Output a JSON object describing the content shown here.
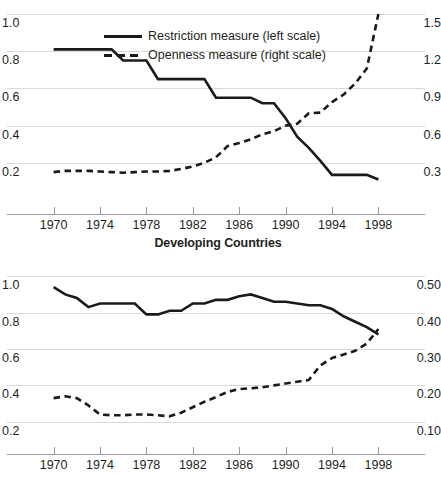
{
  "legend": {
    "items": [
      {
        "label": "Restriction measure (left scale)",
        "style": "solid",
        "key_name": "legend-key-solid"
      },
      {
        "label": "Openness measure (right scale)",
        "style": "dashed",
        "key_name": "legend-key-dashed"
      }
    ]
  },
  "panels": [
    {
      "id": "top",
      "title": "",
      "chart_data": {
        "type": "line",
        "title": "",
        "xlabel": "",
        "ylabel": "",
        "xlim": [
          1969,
          1999
        ],
        "x_ticks": [
          1970,
          1974,
          1978,
          1982,
          1986,
          1990,
          1994,
          1998
        ],
        "left_axis": {
          "label": "Restriction measure",
          "ticks": [
            "1.0",
            "0.8",
            "0.6",
            "0.4",
            "0.2"
          ],
          "values": [
            1.0,
            0.8,
            0.6,
            0.4,
            0.2
          ],
          "ylim": [
            0.0,
            1.0
          ]
        },
        "right_axis": {
          "label": "Openness measure",
          "ticks": [
            "1.5",
            "1.2",
            "0.9",
            "0.6",
            "0.3"
          ],
          "values": [
            1.5,
            1.2,
            0.9,
            0.6,
            0.3
          ],
          "ylim": [
            0.0,
            1.5
          ]
        },
        "grid": true,
        "legend_position": "top-left",
        "x": [
          1970,
          1971,
          1972,
          1973,
          1974,
          1975,
          1976,
          1977,
          1978,
          1979,
          1980,
          1981,
          1982,
          1983,
          1984,
          1985,
          1986,
          1987,
          1988,
          1989,
          1990,
          1991,
          1992,
          1993,
          1994,
          1995,
          1996,
          1997,
          1998
        ],
        "series": [
          {
            "name": "Restriction measure (left scale)",
            "axis": "left",
            "style": "solid",
            "values": [
              0.81,
              0.81,
              0.81,
              0.81,
              0.81,
              0.81,
              0.75,
              0.75,
              0.75,
              0.65,
              0.65,
              0.65,
              0.65,
              0.65,
              0.55,
              0.55,
              0.55,
              0.55,
              0.52,
              0.52,
              0.44,
              0.34,
              0.28,
              0.21,
              0.135,
              0.135,
              0.135,
              0.135,
              0.11
            ]
          },
          {
            "name": "Openness measure (right scale)",
            "axis": "right",
            "style": "dashed",
            "values": [
              0.225,
              0.235,
              0.235,
              0.235,
              0.23,
              0.225,
              0.22,
              0.225,
              0.23,
              0.23,
              0.235,
              0.25,
              0.27,
              0.3,
              0.345,
              0.435,
              0.46,
              0.49,
              0.53,
              0.555,
              0.6,
              0.615,
              0.7,
              0.705,
              0.79,
              0.85,
              0.94,
              1.06,
              1.5
            ]
          }
        ]
      }
    },
    {
      "id": "bottom",
      "title": "Developing Countries",
      "chart_data": {
        "type": "line",
        "title": "Developing Countries",
        "xlabel": "",
        "ylabel": "",
        "xlim": [
          1969,
          1999
        ],
        "x_ticks": [
          1970,
          1974,
          1978,
          1982,
          1986,
          1990,
          1994,
          1998
        ],
        "left_axis": {
          "label": "Restriction measure",
          "ticks": [
            "1.0",
            "0.8",
            "0.6",
            "0.4",
            "0.2"
          ],
          "values": [
            1.0,
            0.8,
            0.6,
            0.4,
            0.2
          ],
          "ylim": [
            0.1,
            1.1
          ]
        },
        "right_axis": {
          "label": "Openness measure",
          "ticks": [
            "0.50",
            "0.40",
            "0.30",
            "0.20",
            "0.10"
          ],
          "values": [
            0.5,
            0.4,
            0.3,
            0.2,
            0.1
          ],
          "ylim": [
            0.05,
            0.55
          ]
        },
        "grid": true,
        "legend_position": "none",
        "x": [
          1970,
          1971,
          1972,
          1973,
          1974,
          1975,
          1976,
          1977,
          1978,
          1979,
          1980,
          1981,
          1982,
          1983,
          1984,
          1985,
          1986,
          1987,
          1988,
          1989,
          1990,
          1991,
          1992,
          1993,
          1994,
          1995,
          1996,
          1997,
          1998
        ],
        "series": [
          {
            "name": "Restriction measure (left scale)",
            "axis": "left",
            "style": "solid",
            "values": [
              0.94,
              0.9,
              0.88,
              0.83,
              0.85,
              0.85,
              0.85,
              0.85,
              0.79,
              0.79,
              0.81,
              0.81,
              0.85,
              0.85,
              0.87,
              0.87,
              0.89,
              0.9,
              0.88,
              0.86,
              0.86,
              0.85,
              0.84,
              0.84,
              0.82,
              0.78,
              0.75,
              0.72,
              0.68
            ]
          },
          {
            "name": "Openness measure (right scale)",
            "axis": "right",
            "style": "dashed",
            "values": [
              0.165,
              0.17,
              0.165,
              0.145,
              0.12,
              0.118,
              0.118,
              0.12,
              0.12,
              0.118,
              0.115,
              0.125,
              0.14,
              0.155,
              0.168,
              0.182,
              0.19,
              0.192,
              0.195,
              0.2,
              0.205,
              0.21,
              0.215,
              0.255,
              0.275,
              0.285,
              0.295,
              0.315,
              0.355
            ]
          }
        ]
      }
    }
  ]
}
